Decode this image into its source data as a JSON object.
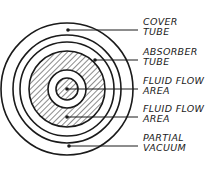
{
  "diagram": {
    "type": "cross-section",
    "center": [
      67,
      89
    ],
    "colors": {
      "stroke": "#1a1a1a",
      "background": "#ffffff"
    },
    "circles": [
      {
        "name": "cover-tube-outer",
        "r": 66
      },
      {
        "name": "cover-tube-inner",
        "r": 54
      },
      {
        "name": "absorber-tube-outer",
        "r": 47
      },
      {
        "name": "absorber-hatched-outer",
        "r": 38,
        "hatched": true
      },
      {
        "name": "inner-ring",
        "r": 19
      },
      {
        "name": "inner-core",
        "r": 11,
        "hatched": true
      }
    ],
    "labels": [
      {
        "id": "cover",
        "line1": "COVER",
        "line2": "TUBE",
        "dot": [
          68,
          30
        ],
        "line_y": 30,
        "text_y": 22
      },
      {
        "id": "absorber",
        "line1": "ABSORBER",
        "line2": "TUBE",
        "dot": [
          95,
          60
        ],
        "line_y": 60,
        "text_y": 52
      },
      {
        "id": "fluid1",
        "line1": "FLUID FLOW",
        "line2": "AREA",
        "dot": [
          67,
          89
        ],
        "line_y": 89,
        "text_y": 81
      },
      {
        "id": "fluid2",
        "line1": "FLUID FLOW",
        "line2": "AREA",
        "dot": [
          67,
          117
        ],
        "line_y": 117,
        "text_y": 109
      },
      {
        "id": "vacuum",
        "line1": "PARTIAL",
        "line2": "VACUUM",
        "dot": [
          69,
          146
        ],
        "line_y": 146,
        "text_y": 138
      }
    ]
  }
}
